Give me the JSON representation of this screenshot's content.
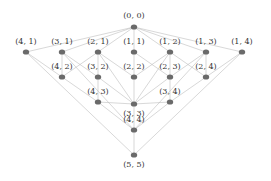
{
  "diagram": {
    "type": "lattice",
    "nodes": [
      {
        "id": "0,0",
        "label": "(0, 0)",
        "x": 134,
        "y": 27
      },
      {
        "id": "4,1",
        "label": "(4, 1)",
        "x": 26,
        "y": 52
      },
      {
        "id": "3,1",
        "label": "(3, 1)",
        "x": 62,
        "y": 52
      },
      {
        "id": "2,1",
        "label": "(2, 1)",
        "x": 98,
        "y": 52
      },
      {
        "id": "1,1",
        "label": "(1, 1)",
        "x": 134,
        "y": 52
      },
      {
        "id": "1,2",
        "label": "(1, 2)",
        "x": 170,
        "y": 52
      },
      {
        "id": "1,3",
        "label": "(1, 3)",
        "x": 206,
        "y": 52
      },
      {
        "id": "1,4",
        "label": "(1, 4)",
        "x": 242,
        "y": 52
      },
      {
        "id": "4,2",
        "label": "(4, 2)",
        "x": 62,
        "y": 77
      },
      {
        "id": "3,2",
        "label": "(3, 2)",
        "x": 98,
        "y": 77
      },
      {
        "id": "2,2",
        "label": "(2, 2)",
        "x": 134,
        "y": 77
      },
      {
        "id": "2,3",
        "label": "(2, 3)",
        "x": 170,
        "y": 77
      },
      {
        "id": "2,4",
        "label": "(2, 4)",
        "x": 206,
        "y": 77
      },
      {
        "id": "4,3",
        "label": "(4, 3)",
        "x": 98,
        "y": 102
      },
      {
        "id": "3,4",
        "label": "(3, 4)",
        "x": 170,
        "y": 102
      },
      {
        "id": "3,3",
        "label": "(3, 3)",
        "x": 134,
        "y": 104
      },
      {
        "id": "4,4",
        "label": "(4, 4)",
        "x": 134,
        "y": 130
      },
      {
        "id": "5,5",
        "label": "(5, 5)",
        "x": 134,
        "y": 155
      }
    ],
    "label_offsets": {
      "0,0": [
        0,
        -9
      ],
      "4,1": [
        0,
        -8
      ],
      "3,1": [
        0,
        -8
      ],
      "2,1": [
        0,
        -8
      ],
      "1,1": [
        0,
        -8
      ],
      "1,2": [
        0,
        -8
      ],
      "1,3": [
        0,
        -8
      ],
      "1,4": [
        0,
        -8
      ],
      "4,2": [
        0,
        -8
      ],
      "3,2": [
        0,
        -8
      ],
      "2,2": [
        0,
        -8
      ],
      "2,3": [
        0,
        -8
      ],
      "2,4": [
        0,
        -8
      ],
      "4,3": [
        0,
        -8
      ],
      "3,4": [
        0,
        -8
      ],
      "3,3": [
        0,
        12
      ],
      "4,4": [
        0,
        -8
      ],
      "5,5": [
        0,
        12
      ]
    },
    "edges": [
      [
        "0,0",
        "4,1"
      ],
      [
        "0,0",
        "3,1"
      ],
      [
        "0,0",
        "2,1"
      ],
      [
        "0,0",
        "1,1"
      ],
      [
        "0,0",
        "1,2"
      ],
      [
        "0,0",
        "1,3"
      ],
      [
        "0,0",
        "1,4"
      ],
      [
        "4,1",
        "4,2"
      ],
      [
        "3,1",
        "4,2"
      ],
      [
        "3,1",
        "3,2"
      ],
      [
        "2,1",
        "3,2"
      ],
      [
        "2,1",
        "2,2"
      ],
      [
        "1,1",
        "2,2"
      ],
      [
        "1,1",
        "2,3"
      ],
      [
        "1,2",
        "2,3"
      ],
      [
        "1,2",
        "2,4"
      ],
      [
        "1,3",
        "2,4"
      ],
      [
        "1,3",
        "2,3"
      ],
      [
        "1,4",
        "2,4"
      ],
      [
        "2,1",
        "4,2"
      ],
      [
        "1,2",
        "2,2"
      ],
      [
        "4,2",
        "4,3"
      ],
      [
        "3,2",
        "4,3"
      ],
      [
        "2,2",
        "3,3"
      ],
      [
        "2,3",
        "3,4"
      ],
      [
        "2,4",
        "3,4"
      ],
      [
        "3,2",
        "3,3"
      ],
      [
        "2,3",
        "3,3"
      ],
      [
        "4,3",
        "3,3"
      ],
      [
        "3,4",
        "3,3"
      ],
      [
        "3,3",
        "4,4"
      ],
      [
        "4,3",
        "4,4"
      ],
      [
        "3,4",
        "4,4"
      ],
      [
        "4,4",
        "5,5"
      ],
      [
        "4,1",
        "5,5"
      ],
      [
        "1,4",
        "5,5"
      ],
      [
        "3,1",
        "4,4"
      ],
      [
        "1,3",
        "4,4"
      ],
      [
        "2,1",
        "3,3"
      ],
      [
        "1,2",
        "3,3"
      ]
    ],
    "colors": {
      "node": "#6a6a6a",
      "edge": "#bdbdbd",
      "label": "#333333",
      "background": "#ffffff"
    }
  }
}
